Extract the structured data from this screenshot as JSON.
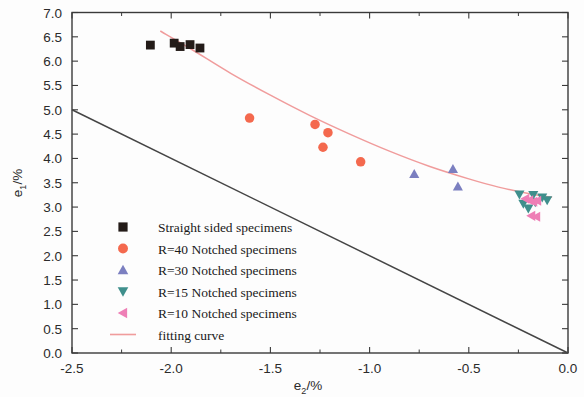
{
  "chart_data": {
    "type": "scatter",
    "title": "",
    "xlabel": "e2/%",
    "ylabel": "e1/%",
    "xlim": [
      -2.5,
      0.0
    ],
    "ylim": [
      0.0,
      7.0
    ],
    "xticks": [
      -2.5,
      -2.0,
      -1.5,
      -1.0,
      -0.5,
      0.0
    ],
    "xtick_labels": [
      "-2.5",
      "-2.0",
      "-1.5",
      "-1.0",
      "-0.5",
      "0.0"
    ],
    "yticks": [
      0.0,
      0.5,
      1.0,
      1.5,
      2.0,
      2.5,
      3.0,
      3.5,
      4.0,
      4.5,
      5.0,
      5.5,
      6.0,
      6.5,
      7.0
    ],
    "ytick_labels": [
      "0.0",
      "0.5",
      "1.0",
      "1.5",
      "2.0",
      "2.5",
      "3.0",
      "3.5",
      "4.0",
      "4.5",
      "5.0",
      "5.5",
      "6.0",
      "6.5",
      "7.0"
    ],
    "grid": false,
    "legend_position": "lower-left",
    "series": [
      {
        "name": "Straight sided specimens",
        "marker": "square",
        "color": "#231b18",
        "points": [
          {
            "x": -2.105,
            "y": 6.33
          },
          {
            "x": -1.985,
            "y": 6.37
          },
          {
            "x": -1.955,
            "y": 6.3
          },
          {
            "x": -1.905,
            "y": 6.34
          },
          {
            "x": -1.855,
            "y": 6.27
          }
        ]
      },
      {
        "name": "R=40 Notched specimens",
        "marker": "circle",
        "color": "#f4694e",
        "points": [
          {
            "x": -1.605,
            "y": 4.83
          },
          {
            "x": -1.275,
            "y": 4.7
          },
          {
            "x": -1.21,
            "y": 4.53
          },
          {
            "x": -1.235,
            "y": 4.23
          },
          {
            "x": -1.045,
            "y": 3.93
          }
        ]
      },
      {
        "name": "R=30 Notched specimens",
        "marker": "triangle-up",
        "color": "#7b7fc0",
        "points": [
          {
            "x": -0.775,
            "y": 3.68
          },
          {
            "x": -0.58,
            "y": 3.78
          },
          {
            "x": -0.555,
            "y": 3.42
          }
        ]
      },
      {
        "name": "R=15 Notched specimens",
        "marker": "triangle-down",
        "color": "#3f8f8c",
        "points": [
          {
            "x": -0.245,
            "y": 3.26
          },
          {
            "x": -0.175,
            "y": 3.25
          },
          {
            "x": -0.13,
            "y": 3.2
          },
          {
            "x": -0.225,
            "y": 3.07
          },
          {
            "x": -0.165,
            "y": 3.1
          },
          {
            "x": -0.105,
            "y": 3.14
          },
          {
            "x": -0.2,
            "y": 2.97
          }
        ]
      },
      {
        "name": "R=10 Notched specimens",
        "marker": "triangle-left",
        "color": "#ee7fb6",
        "points": [
          {
            "x": -0.215,
            "y": 3.17
          },
          {
            "x": -0.195,
            "y": 3.14
          },
          {
            "x": -0.175,
            "y": 3.11
          },
          {
            "x": -0.155,
            "y": 3.13
          },
          {
            "x": -0.185,
            "y": 2.82
          },
          {
            "x": -0.16,
            "y": 2.8
          }
        ]
      }
    ],
    "fitting_curve": {
      "name": "fitting curve",
      "color": "#f09c9c",
      "points": [
        {
          "x": -2.055,
          "y": 6.62
        },
        {
          "x": -1.9,
          "y": 6.25
        },
        {
          "x": -1.7,
          "y": 5.75
        },
        {
          "x": -1.5,
          "y": 5.3
        },
        {
          "x": -1.3,
          "y": 4.88
        },
        {
          "x": -1.1,
          "y": 4.5
        },
        {
          "x": -0.9,
          "y": 4.15
        },
        {
          "x": -0.7,
          "y": 3.84
        },
        {
          "x": -0.5,
          "y": 3.58
        },
        {
          "x": -0.35,
          "y": 3.41
        },
        {
          "x": -0.2,
          "y": 3.28
        },
        {
          "x": -0.08,
          "y": 3.2
        }
      ]
    },
    "reference_line": {
      "name": "reference-line",
      "color": "#454545",
      "points": [
        {
          "x": -2.5,
          "y": 5.0
        },
        {
          "x": 0.0,
          "y": 0.0
        }
      ]
    }
  },
  "legend": {
    "entries": [
      {
        "label": "Straight sided specimens",
        "marker": "square",
        "color": "#231b18"
      },
      {
        "label": "R=40 Notched specimens",
        "marker": "circle",
        "color": "#f4694e"
      },
      {
        "label": "R=30 Notched specimens",
        "marker": "triangle-up",
        "color": "#7b7fc0"
      },
      {
        "label": "R=15 Notched specimens",
        "marker": "triangle-down",
        "color": "#3f8f8c"
      },
      {
        "label": "R=10 Notched specimens",
        "marker": "triangle-left",
        "color": "#ee7fb6"
      },
      {
        "label": "fitting curve",
        "marker": "line",
        "color": "#f09c9c"
      }
    ]
  },
  "axes": {
    "x_title_base": "e",
    "x_title_sub": "2",
    "x_title_unit": "/%",
    "y_title_base": "e",
    "y_title_sub": "1",
    "y_title_unit": "/%"
  }
}
